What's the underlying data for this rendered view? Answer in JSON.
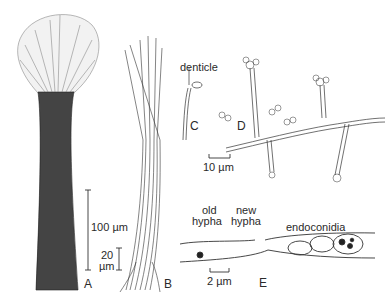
{
  "figure": {
    "panels": [
      {
        "id": "A",
        "description": "synnema with spreading conidial head"
      },
      {
        "id": "B",
        "description": "loose bundle of hyphae"
      },
      {
        "id": "C",
        "description": "conidiophore tip"
      },
      {
        "id": "D",
        "description": "branched hyphae bearing conidial clusters"
      },
      {
        "id": "E",
        "description": "hypha with endoconidia"
      }
    ],
    "labels": {
      "panel_a": "A",
      "panel_b": "B",
      "panel_c": "C",
      "panel_d": "D",
      "panel_e": "E",
      "denticle": "denticle",
      "old_hypha_1": "old",
      "old_hypha_2": "hypha",
      "new_hypha_1": "new",
      "new_hypha_2": "hypha",
      "endoconidia": "endoconidia"
    },
    "scale_bars": {
      "a": "100 µm",
      "b_1": "20",
      "b_2": "µm",
      "d": "10 µm",
      "e": "2 µm"
    },
    "colors": {
      "ink": "#2a2a2a",
      "background": "#ffffff"
    }
  }
}
